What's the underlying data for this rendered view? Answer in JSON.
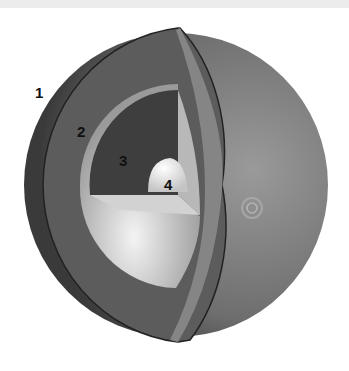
{
  "diagram": {
    "labels": [
      {
        "id": "1",
        "text": "1",
        "x": 35,
        "y": 85
      },
      {
        "id": "2",
        "text": "2",
        "x": 77,
        "y": 124
      },
      {
        "id": "3",
        "text": "3",
        "x": 119,
        "y": 153
      },
      {
        "id": "4",
        "text": "4",
        "x": 164,
        "y": 177
      }
    ],
    "colors": {
      "outer_layer": "#5a5a5a",
      "surface": "#7a7a7a",
      "second_layer": "#c8c8c8",
      "third_layer": "#3e3e3e",
      "core": "#e6e6e6"
    }
  }
}
